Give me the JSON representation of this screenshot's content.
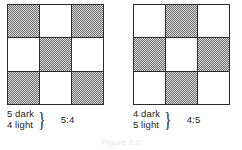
{
  "figure": {
    "panels": [
      {
        "name": "left",
        "grid": {
          "rows": 3,
          "cols": 3,
          "cells": [
            [
              "dark",
              "light",
              "dark"
            ],
            [
              "light",
              "dark",
              "light"
            ],
            [
              "dark",
              "light",
              "dark"
            ]
          ]
        },
        "caption": {
          "dark_count": "5 dark",
          "light_count": "4 light",
          "brace": "}",
          "ratio": "5:4"
        }
      },
      {
        "name": "right",
        "grid": {
          "rows": 3,
          "cols": 3,
          "cells": [
            [
              "light",
              "dark",
              "light"
            ],
            [
              "dark",
              "light",
              "dark"
            ],
            [
              "light",
              "dark",
              "light"
            ]
          ]
        },
        "caption": {
          "dark_count": "4 dark",
          "light_count": "5 light",
          "brace": "}",
          "ratio": "4:5"
        }
      }
    ],
    "bottom_caption": "Figure 2.2",
    "colors": {
      "grid_line": "#2b2b2b",
      "dark_cell": "#9a9a9a",
      "light_cell": "#ffffff",
      "text": "#1a1a1a",
      "background": "#ffffff"
    }
  }
}
